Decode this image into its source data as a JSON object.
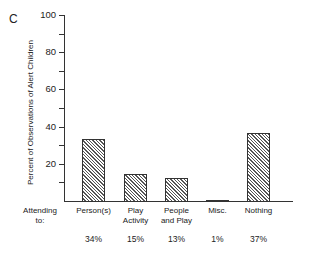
{
  "panel_label": "C",
  "chart_data": {
    "type": "bar",
    "title": "",
    "xlabel": "Attending to:",
    "ylabel": "Percent of Observations of Alert Children",
    "ylim": [
      0,
      100
    ],
    "yticks": [
      0,
      10,
      20,
      30,
      40,
      50,
      60,
      70,
      80,
      90,
      100
    ],
    "ytick_labels": [
      "20",
      "40",
      "60",
      "80",
      "100"
    ],
    "grid": false,
    "legend": null,
    "categories": [
      "Person(s)",
      "Play Activity",
      "People and Play",
      "Misc.",
      "Nothing"
    ],
    "category_lines": [
      [
        "Person(s)",
        ""
      ],
      [
        "Play",
        "Activity"
      ],
      [
        "People",
        "and Play"
      ],
      [
        "Misc.",
        ""
      ],
      [
        "Nothing",
        ""
      ]
    ],
    "values": [
      34,
      15,
      13,
      1,
      37
    ],
    "value_labels": [
      "34%",
      "15%",
      "13%",
      "1%",
      "37%"
    ],
    "bar_fill": "diagonal hatch"
  },
  "x_prefix": {
    "line1": "Attending",
    "line2": "to:"
  }
}
